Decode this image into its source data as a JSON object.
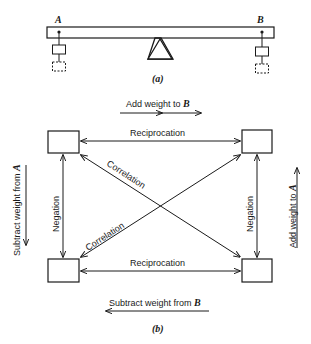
{
  "panel_a": {
    "label_a": "A",
    "label_b": "B",
    "caption": "(a)"
  },
  "panel_b": {
    "top_label": "Add weight to",
    "top_label_var": "B",
    "bottom_label": "Subtract weight from",
    "bottom_label_var": "B",
    "left_label": "Subtract weight from",
    "left_label_var": "A",
    "right_label": "Add weight to",
    "right_label_var": "A",
    "edge_top": "Reciprocation",
    "edge_bottom": "Reciprocation",
    "edge_left": "Negation",
    "edge_right": "Negation",
    "diag_upper": "Correlation",
    "diag_lower": "Correlation",
    "caption": "(b)"
  },
  "colors": {
    "ink": "#1a1a1a",
    "background": "#ffffff"
  }
}
